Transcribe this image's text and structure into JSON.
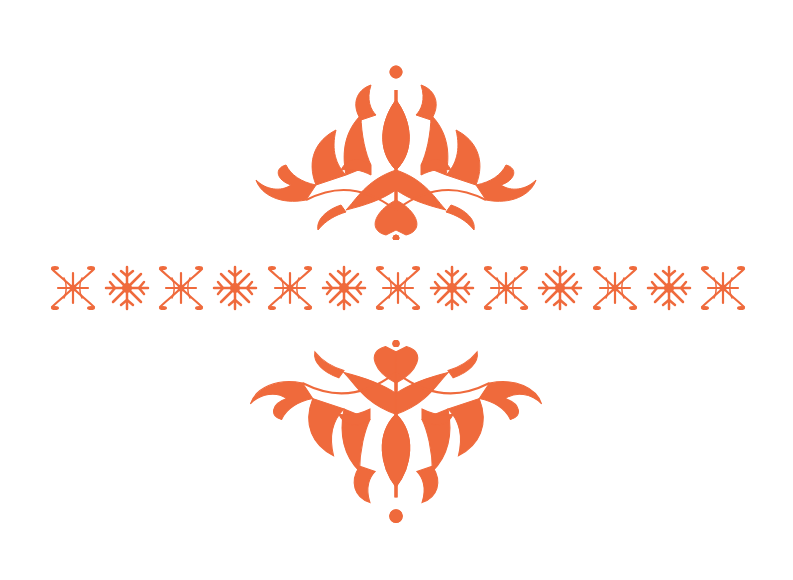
{
  "page": {
    "background": "#ffffff",
    "accent_color": "#ef6a3c"
  },
  "ornaments": {
    "top": {
      "name": "top-damask-ornament",
      "orientation": "up"
    },
    "bottom": {
      "name": "bottom-damask-ornament",
      "orientation": "down"
    }
  },
  "border": {
    "pattern": [
      "ornate",
      "simple",
      "ornate",
      "simple",
      "ornate",
      "simple",
      "ornate",
      "simple",
      "ornate",
      "simple",
      "ornate",
      "simple",
      "ornate"
    ],
    "count": 13
  }
}
